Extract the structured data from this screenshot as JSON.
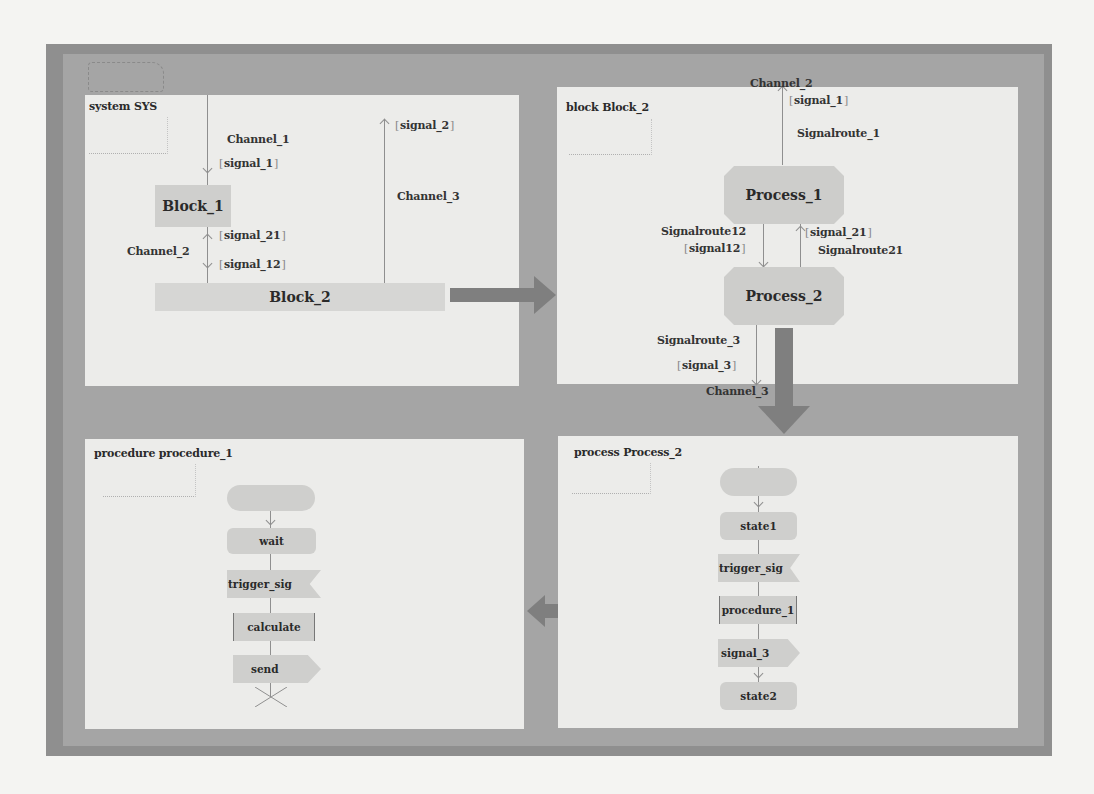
{
  "panels": {
    "system": {
      "title": "system SYS",
      "blocks": [
        "Block_1",
        "Block_2"
      ],
      "channels": [
        "Channel_1",
        "Channel_2",
        "Channel_3"
      ],
      "signals": {
        "channel_1": "signal_1",
        "channel_2_up": "signal_21",
        "channel_2_down": "signal_12",
        "channel_3": "signal_2"
      }
    },
    "block": {
      "title": "block Block_2",
      "processes": [
        "Process_1",
        "Process_2"
      ],
      "external_channels": {
        "top": "Channel_2",
        "bottom": "Channel_3"
      },
      "signalroutes": {
        "r1": "Signalroute_1",
        "r12": "Signalroute12",
        "r21": "Signalroute21",
        "r3": "Signalroute_3"
      },
      "signals": {
        "r1": "signal_1",
        "r12": "signal12",
        "r21": "signal_21",
        "r3": "signal_3"
      }
    },
    "process": {
      "title": "process Process_2",
      "steps": [
        "",
        "state1",
        "trigger_sig",
        "procedure_1",
        "signal_3",
        "state2"
      ]
    },
    "procedure": {
      "title": "procedure procedure_1",
      "steps": [
        "",
        "wait",
        "trigger_sig",
        "calculate",
        "send"
      ]
    }
  },
  "colors": {
    "frame_outer": "#8f8f8f",
    "frame_inner": "#a5a5a5",
    "panel_bg": "#ececea",
    "shape_fill": "#cfcfcd",
    "arrow_fill": "#7f7f7f"
  }
}
